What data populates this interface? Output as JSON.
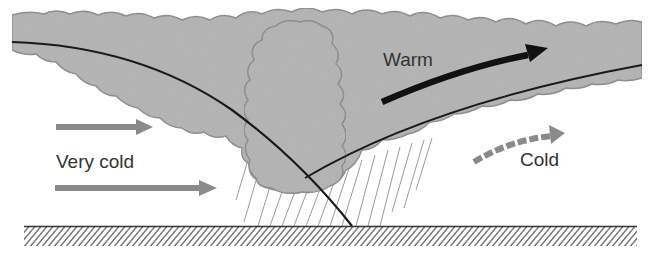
{
  "diagram": {
    "type": "occluded-front-cross-section",
    "labels": {
      "warm": "Warm",
      "very_cold": "Very cold",
      "cold": "Cold"
    },
    "colors": {
      "cloud_fill": "#b3b3b3",
      "cloud_outline": "#8a8a8a",
      "front_line": "#1a1a1a",
      "warm_arrow": "#111111",
      "cold_arrow": "#8a8a8a",
      "ground": "#444444",
      "rain": "#9a9a9a",
      "text": "#333333"
    },
    "elements": [
      {
        "id": "cloud-mass",
        "kind": "cloud"
      },
      {
        "id": "cumulus-tower",
        "kind": "cloud"
      },
      {
        "id": "cold-front-boundary",
        "kind": "line"
      },
      {
        "id": "warm-front-boundary",
        "kind": "line"
      },
      {
        "id": "warm-air-arrow",
        "kind": "arrow",
        "style": "solid-black"
      },
      {
        "id": "very-cold-arrow-upper",
        "kind": "arrow",
        "style": "solid-gray"
      },
      {
        "id": "very-cold-arrow-lower",
        "kind": "arrow",
        "style": "solid-gray"
      },
      {
        "id": "cold-air-arrow",
        "kind": "arrow",
        "style": "dashed-gray"
      },
      {
        "id": "precipitation",
        "kind": "rain-streaks"
      },
      {
        "id": "ground-surface",
        "kind": "hatched-ground"
      }
    ]
  }
}
